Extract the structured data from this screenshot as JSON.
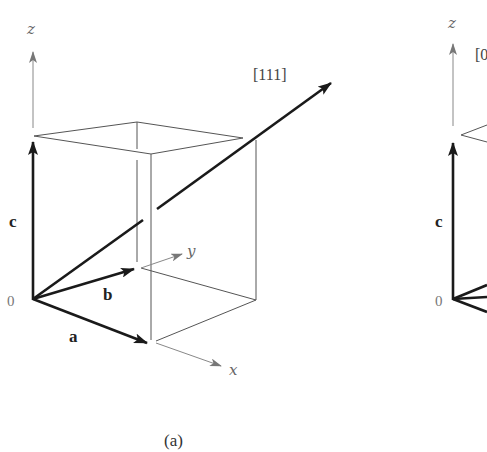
{
  "panel_a": {
    "axes": {
      "x": "x",
      "y": "y",
      "z": "z"
    },
    "origin": "0",
    "vectors": {
      "a": "a",
      "b": "b",
      "c": "c"
    },
    "direction": "[111]",
    "caption": "(a)"
  },
  "panel_b": {
    "axes": {
      "z": "z"
    },
    "origin": "0",
    "vectors": {
      "c": "c"
    },
    "direction_partial": "[0"
  },
  "colors": {
    "vector": "#1a1a1a",
    "cube_edge": "#555555",
    "axis": "#888888"
  }
}
